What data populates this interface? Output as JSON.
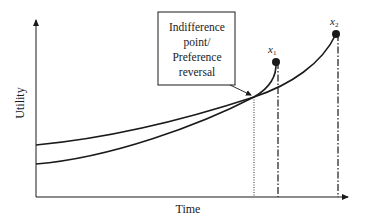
{
  "diagram": {
    "type": "hyperbolic-discounting-preference-reversal",
    "axes": {
      "y_label": "Utility",
      "x_label": "Time"
    },
    "annotation_box": {
      "lines": [
        "Indifference",
        "point/",
        "Preference",
        "reversal"
      ]
    },
    "points": [
      {
        "id": "x1",
        "label": "x",
        "subscript": "1"
      },
      {
        "id": "x2",
        "label": "x",
        "subscript": "2"
      }
    ],
    "curves": [
      {
        "name": "utility-curve-x2",
        "description": "higher starting, gradually rising to x2 (later, larger reward)"
      },
      {
        "name": "utility-curve-x1",
        "description": "lower starting, steeply rising to x1 (earlier, smaller reward)"
      }
    ],
    "reference_lines": [
      {
        "name": "indifference-time-line",
        "style": "dotted"
      },
      {
        "name": "x1-time-line",
        "style": "dash-dot"
      },
      {
        "name": "x2-time-line",
        "style": "dash-dot"
      }
    ],
    "colors": {
      "ink": "#1a1a1a",
      "background": "#ffffff"
    }
  }
}
